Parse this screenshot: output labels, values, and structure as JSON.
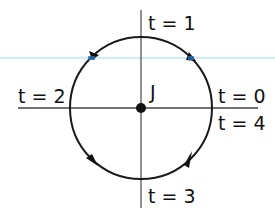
{
  "diagram": {
    "center_label": "J",
    "labels": {
      "top": "t = 1",
      "left": "t = 2",
      "right_upper": "t = 0",
      "right_lower": "t = 4",
      "bottom": "t = 3"
    },
    "colors": {
      "stroke": "#1a1a1a",
      "axis": "#555555",
      "guide": "#cfe8f3",
      "arrow_highlight": "#2a6fb5",
      "background": "#ffffff"
    },
    "direction": "counterclockwise"
  }
}
